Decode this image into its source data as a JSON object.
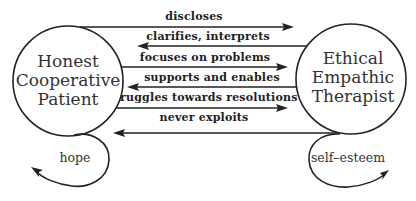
{
  "diagram": {
    "nodes": {
      "patient": {
        "lines": [
          "Honest",
          "Cooperative",
          "Patient"
        ]
      },
      "therapist": {
        "lines": [
          "Ethical",
          "Empathic",
          "Therapist"
        ]
      }
    },
    "edges": [
      {
        "label": "discloses",
        "direction": "patient-to-therapist"
      },
      {
        "label": "clarifies, interprets",
        "direction": "therapist-to-patient"
      },
      {
        "label": "focuses on problems",
        "direction": "patient-to-therapist"
      },
      {
        "label": "supports and enables",
        "direction": "therapist-to-patient"
      },
      {
        "label": "struggles towards resolutions",
        "direction": "patient-to-therapist"
      },
      {
        "label": "never exploits",
        "direction": "therapist-to-patient"
      }
    ],
    "loops": {
      "patient": {
        "label": "hope"
      },
      "therapist": {
        "label": "self–esteem"
      }
    },
    "colors": {
      "stroke": "#222222",
      "text": "#333333",
      "background": "#ffffff"
    }
  }
}
